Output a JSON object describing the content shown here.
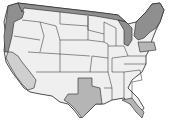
{
  "map": {
    "title": "United States map with highlighted border states",
    "colors": {
      "background": "#ffffff",
      "interior_state": "#efefef",
      "border_dark": "#8f8f8f",
      "border_medium": "#b5b5b5",
      "border_light": "#cfcfcf",
      "outline": "#222222"
    },
    "highlighted_regions": [
      {
        "name": "Washington-Oregon coast",
        "shade": "dark"
      },
      {
        "name": "California",
        "shade": "light"
      },
      {
        "name": "Northern border (ID/MT/ND/MN)",
        "shade": "dark"
      },
      {
        "name": "Great Lakes (MI/OH)",
        "shade": "dark"
      },
      {
        "name": "New York / New England",
        "shade": "dark"
      },
      {
        "name": "Pennsylvania",
        "shade": "medium"
      },
      {
        "name": "Texas",
        "shade": "medium"
      },
      {
        "name": "Florida",
        "shade": "medium"
      }
    ],
    "caption": "· · · · · · · · ·"
  }
}
